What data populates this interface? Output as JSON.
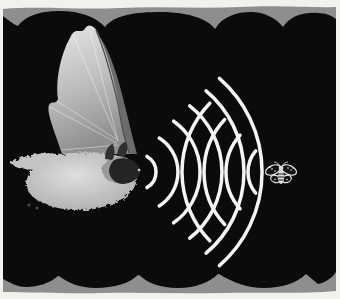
{
  "figure": {
    "elements": {
      "bat": {
        "label": "bat",
        "position": "left"
      },
      "moth": {
        "label": "moth",
        "position": "right"
      },
      "emitted_waves_label": "emitted ultrasonic sound waves",
      "echo_waves_label": "returning echo waves"
    },
    "colors": {
      "frame": "#f2f1ee",
      "border_band": "#8e8e8e",
      "background": "#0b0b0b",
      "wave": "#f4f4f4",
      "bat_membrane_light": "#e2e2e2",
      "bat_membrane_dark": "#8f8f8f",
      "bat_body_light": "#dcdcdc",
      "bat_body_dark": "#8a8a8a",
      "moth_line": "#e8e8e8"
    },
    "waves": {
      "emitted": {
        "cx": 138,
        "cy": 172,
        "mid_angle": 0,
        "radii": [
          18,
          40,
          62,
          84,
          106,
          124
        ],
        "half_spans": [
          60,
          58,
          55,
          52,
          50,
          49
        ],
        "count": 6
      },
      "echo": {
        "cx": 281,
        "cy": 172,
        "mid_angle": 180,
        "radii": [
          33,
          55,
          77,
          99
        ],
        "half_spans": [
          40,
          42,
          43,
          44
        ],
        "count": 4
      }
    }
  }
}
